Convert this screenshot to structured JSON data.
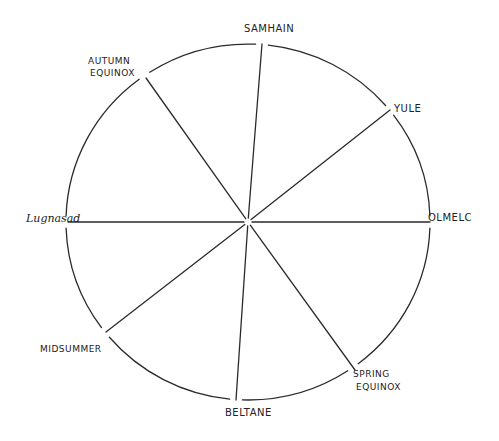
{
  "diagram": {
    "type": "wheel",
    "stroke_color": "#2a2a2a",
    "background": "#ffffff",
    "center": [
      248,
      222
    ],
    "radius": [
      182,
      178
    ],
    "spokes": [
      {
        "name": "samhain",
        "end": [
          262,
          44
        ]
      },
      {
        "name": "yule",
        "end": [
          390,
          110
        ]
      },
      {
        "name": "olmelc",
        "end": [
          430,
          222
        ]
      },
      {
        "name": "spring-equinox",
        "end": [
          355,
          370
        ]
      },
      {
        "name": "beltane",
        "end": [
          236,
          400
        ]
      },
      {
        "name": "midsummer",
        "end": [
          106,
          332
        ]
      },
      {
        "name": "lugnasad",
        "end": [
          68,
          222
        ]
      },
      {
        "name": "autumn-equinox",
        "end": [
          146,
          78
        ]
      }
    ],
    "labels": {
      "samhain": "SAMHAIN",
      "autumn_equinox_line1": "AUTUMN",
      "autumn_equinox_line2": "EQUINOX",
      "yule": "YULE",
      "lugnasad": "Lugnasad",
      "olmelc": "OLMELC",
      "midsummer": "MIDSUMMER",
      "spring_equinox_line1": "SPRING",
      "spring_equinox_line2": "EQUINOX",
      "beltane": "BELTANE"
    }
  }
}
